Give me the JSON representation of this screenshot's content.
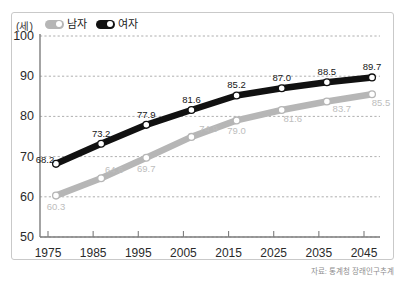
{
  "legend": {
    "items": [
      {
        "label": "남자",
        "color": "#b6b6b6",
        "key": "male"
      },
      {
        "label": "여자",
        "color": "#111111",
        "key": "female"
      }
    ]
  },
  "axis": {
    "unit_label": "(세)",
    "y_ticks": [
      "100",
      "90",
      "80",
      "70",
      "60",
      "50"
    ],
    "x_ticks": [
      "1975",
      "1985",
      "1995",
      "2005",
      "2015",
      "2025",
      "2035",
      "2045"
    ]
  },
  "source": {
    "text": "자료: 통계청 장래인구추계"
  },
  "chart_data": {
    "type": "line",
    "title": "",
    "xlabel": "",
    "ylabel": "(세)",
    "ylim": [
      50,
      100
    ],
    "y_tick_step": 10,
    "grid": true,
    "grid_style": "dashed",
    "legend_position": "top-left",
    "categories": [
      "1975",
      "1985",
      "1995",
      "2005",
      "2015",
      "2025",
      "2035",
      "2045"
    ],
    "series": [
      {
        "name": "남자",
        "key": "male",
        "color": "#b6b6b6",
        "label_color": "#bdbdbd",
        "values": [
          60.3,
          64.6,
          69.7,
          74.9,
          79.0,
          81.6,
          83.7,
          85.5
        ],
        "labels": [
          "60.3",
          "64.6",
          "69.7",
          "74.9",
          "79.0",
          "81.6",
          "83.7",
          "85.5"
        ]
      },
      {
        "name": "여자",
        "key": "female",
        "color": "#111111",
        "label_color": "#161616",
        "values": [
          68.2,
          73.2,
          77.9,
          81.6,
          85.2,
          87.0,
          88.5,
          89.7
        ],
        "labels": [
          "68.2",
          "73.2",
          "77.9",
          "81.6",
          "85.2",
          "87.0",
          "88.5",
          "89.7"
        ]
      }
    ]
  }
}
